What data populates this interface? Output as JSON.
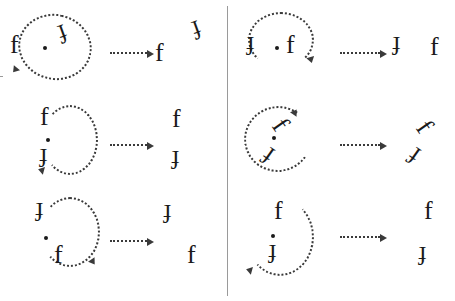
{
  "figure": {
    "title": "Rotation task stimuli: letter f pairs with dotted rotation arcs",
    "glyph_letter": "f",
    "divider_color": "#9a9a9a",
    "ink_color": "#1a1a1a",
    "arc_color": "#3a3a3a"
  },
  "columns": [
    {
      "id": "left-column",
      "rows": [
        {
          "id": "left-row-1",
          "source": {
            "glyphs": [
              {
                "label": "f",
                "rotation": 0
              },
              {
                "label": "f",
                "rotation": 160
              }
            ],
            "pivot": true,
            "arc": {
              "direction": "counterclockwise",
              "sweep": "270"
            }
          },
          "arrow": "dotted-right-arrow",
          "target": {
            "glyphs": [
              {
                "label": "f",
                "rotation": 0
              },
              {
                "label": "f",
                "rotation": 160
              }
            ]
          }
        },
        {
          "id": "left-row-2",
          "source": {
            "glyphs": [
              {
                "label": "f",
                "rotation": 0
              },
              {
                "label": "f",
                "rotation": 180
              }
            ],
            "pivot": true,
            "arc": {
              "direction": "clockwise",
              "sweep": "270"
            }
          },
          "arrow": "dotted-right-arrow",
          "target": {
            "glyphs": [
              {
                "label": "f",
                "rotation": 0
              },
              {
                "label": "f",
                "rotation": 180
              }
            ]
          }
        },
        {
          "id": "left-row-3",
          "source": {
            "glyphs": [
              {
                "label": "f",
                "rotation": 180
              },
              {
                "label": "f",
                "rotation": 0
              }
            ],
            "pivot": true,
            "arc": {
              "direction": "clockwise",
              "sweep": "270"
            }
          },
          "arrow": "dotted-right-arrow",
          "target": {
            "glyphs": [
              {
                "label": "f",
                "rotation": 180
              },
              {
                "label": "f",
                "rotation": 0
              }
            ]
          }
        }
      ]
    },
    {
      "id": "right-column",
      "rows": [
        {
          "id": "right-row-1",
          "source": {
            "glyphs": [
              {
                "label": "f",
                "rotation": 180
              },
              {
                "label": "f",
                "rotation": 0
              }
            ],
            "pivot": true,
            "arc": {
              "direction": "clockwise",
              "sweep": "300"
            }
          },
          "arrow": "dotted-right-arrow",
          "target": {
            "glyphs": [
              {
                "label": "f",
                "rotation": 180
              },
              {
                "label": "f",
                "rotation": 0
              }
            ]
          }
        },
        {
          "id": "right-row-2",
          "source": {
            "glyphs": [
              {
                "label": "f",
                "rotation": 55
              },
              {
                "label": "f",
                "rotation": 215
              }
            ],
            "pivot": true,
            "arc": {
              "direction": "counterclockwise",
              "sweep": "300"
            }
          },
          "arrow": "dotted-right-arrow",
          "target": {
            "glyphs": [
              {
                "label": "f",
                "rotation": 55
              },
              {
                "label": "f",
                "rotation": 215
              }
            ]
          }
        },
        {
          "id": "right-row-3",
          "source": {
            "glyphs": [
              {
                "label": "f",
                "rotation": 0
              },
              {
                "label": "f",
                "rotation": 180
              }
            ],
            "pivot": true,
            "arc": {
              "direction": "clockwise",
              "sweep": "300"
            }
          },
          "arrow": "dotted-right-arrow",
          "target": {
            "glyphs": [
              {
                "label": "f",
                "rotation": 0
              },
              {
                "label": "f",
                "rotation": 180
              }
            ]
          }
        }
      ]
    }
  ]
}
